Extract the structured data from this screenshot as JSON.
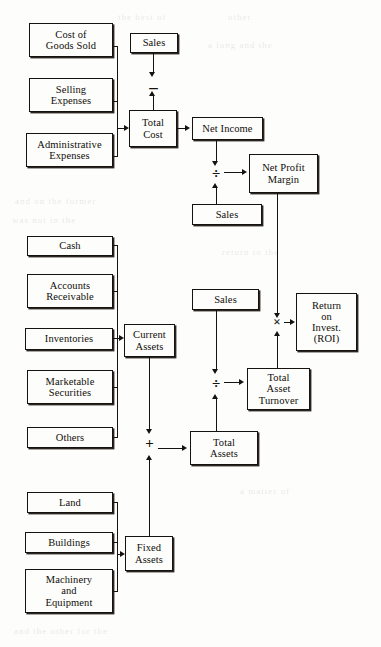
{
  "diagram": {
    "type": "flow-diagram",
    "nodes": {
      "cost_of_goods_sold": "Cost of\nGoods Sold",
      "selling_expenses": "Selling\nExpenses",
      "administrative_expenses": "Administrative\nExpenses",
      "sales_top": "Sales",
      "total_cost": "Total\nCost",
      "net_income": "Net Income",
      "net_profit_margin": "Net Profit\nMargin",
      "sales_margin": "Sales",
      "cash": "Cash",
      "accounts_receivable": "Accounts\nReceivable",
      "inventories": "Inventories",
      "marketable_securities": "Marketable\nSecurities",
      "others": "Others",
      "current_assets": "Current\nAssets",
      "sales_turnover": "Sales",
      "total_asset_turnover": "Total\nAsset\nTurnover",
      "return_on_investment": "Return\non\nInvest.\n(ROI)",
      "total_assets": "Total\nAssets",
      "land": "Land",
      "buildings": "Buildings",
      "machinery_and_equipment": "Machinery\nand\nEquipment",
      "fixed_assets": "Fixed\nAssets"
    },
    "operators": {
      "subtract": "–",
      "divide_margin": "÷",
      "divide_turnover": "÷",
      "multiply": "×",
      "add_assets": "+"
    },
    "colors": {
      "ink": "#16130f",
      "paper": "#fdfdfb",
      "shadow": "#2a2520"
    }
  },
  "ghost_text": {
    "g1": "the best of",
    "g2": "other",
    "g3": "a long and the",
    "g4": "and on the former",
    "g5": "was not in the",
    "g6": "return to the",
    "g7": "and the other for the",
    "g8": "a matter of"
  }
}
